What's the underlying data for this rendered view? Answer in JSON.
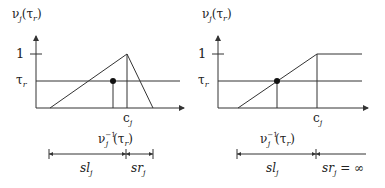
{
  "panels": [
    {
      "name": "left-panel",
      "y_axis_label": {
        "main": "ν",
        "sub": "j",
        "arg": "(τ",
        "argsub": "r",
        "close": ")"
      },
      "y_tick_one": "1",
      "y_tick_tau": {
        "main": "τ",
        "sub": "r"
      },
      "x_tick_c": {
        "main": "c",
        "sub": "j"
      },
      "inverse_label": {
        "main": "ν",
        "sub": "j",
        "sup": "−1",
        "arg": "(τ",
        "argsub": "r",
        "close": ")"
      },
      "shape": "triangle",
      "left_interval": {
        "main": "sl",
        "sub": "j",
        "suffix": ""
      },
      "right_interval": {
        "main": "sr",
        "sub": "j",
        "suffix": ""
      }
    },
    {
      "name": "right-panel",
      "y_axis_label": {
        "main": "ν",
        "sub": "j",
        "arg": "(τ",
        "argsub": "r",
        "close": ")"
      },
      "y_tick_one": "1",
      "y_tick_tau": {
        "main": "τ",
        "sub": "r"
      },
      "x_tick_c": {
        "main": "c",
        "sub": "j"
      },
      "inverse_label": {
        "main": "ν",
        "sub": "j",
        "sup": "−1",
        "arg": "(τ",
        "argsub": "r",
        "close": ")"
      },
      "shape": "ramp-plateau",
      "left_interval": {
        "main": "sl",
        "sub": "j",
        "suffix": ""
      },
      "right_interval": {
        "main": "sr",
        "sub": "j",
        "suffix": " = ∞"
      }
    }
  ]
}
